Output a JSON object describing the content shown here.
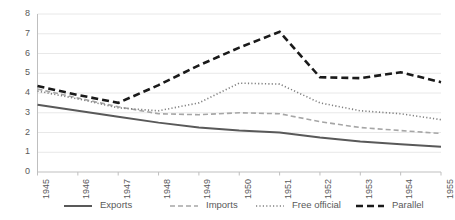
{
  "chart_data": {
    "type": "line",
    "title": "",
    "xlabel": "",
    "ylabel": "",
    "x": [
      1945,
      1946,
      1947,
      1948,
      1949,
      1950,
      1951,
      1952,
      1953,
      1954,
      1955
    ],
    "xticklabels": [
      "1945",
      "1946",
      "1947",
      "1948",
      "1949",
      "1950",
      "1951",
      "1952",
      "1953",
      "1954",
      "1955"
    ],
    "yticklabels": [
      "0",
      "1",
      "2",
      "3",
      "4",
      "5",
      "6",
      "7",
      "8"
    ],
    "yticks": [
      0,
      1,
      2,
      3,
      4,
      5,
      6,
      7,
      8
    ],
    "ylim": [
      0,
      8
    ],
    "grid": "horizontal",
    "legend_position": "bottom",
    "series": [
      {
        "name": "Exports",
        "style": "solid",
        "color": "#595959",
        "width": 2.0,
        "values": [
          3.4,
          3.1,
          2.8,
          2.5,
          2.25,
          2.1,
          2.0,
          1.75,
          1.55,
          1.4,
          1.28
        ]
      },
      {
        "name": "Imports",
        "style": "dashed",
        "color": "#a6a6a6",
        "width": 1.6,
        "values": [
          4.2,
          3.75,
          3.3,
          2.95,
          2.9,
          3.0,
          2.95,
          2.55,
          2.25,
          2.1,
          1.95
        ]
      },
      {
        "name": "Free official",
        "style": "dotted",
        "color": "#808080",
        "width": 1.6,
        "values": [
          4.1,
          3.7,
          3.25,
          3.1,
          3.5,
          4.5,
          4.45,
          3.5,
          3.1,
          2.95,
          2.65
        ]
      },
      {
        "name": "Parallel",
        "style": "bold-dashed",
        "color": "#1a1a1a",
        "width": 2.6,
        "values": [
          4.35,
          3.9,
          3.5,
          4.4,
          5.4,
          6.3,
          7.1,
          4.8,
          4.75,
          5.05,
          4.55
        ]
      }
    ]
  },
  "legend": {
    "items": [
      {
        "label": "Exports"
      },
      {
        "label": "Imports"
      },
      {
        "label": "Free official"
      },
      {
        "label": "Parallel"
      }
    ]
  }
}
